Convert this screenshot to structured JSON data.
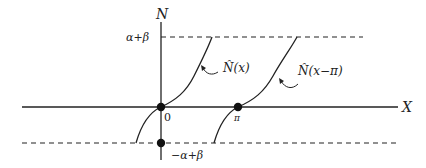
{
  "diagram": {
    "axes": {
      "y_label": "N",
      "x_label": "X"
    },
    "levels": {
      "upper": "α+β",
      "lower": "−α+β"
    },
    "points": {
      "origin": "0",
      "pi": "π"
    },
    "curves": [
      {
        "label_main": "N̂",
        "label_arg": "(x)"
      },
      {
        "label_main": "N̂",
        "label_arg": "(x−π)"
      }
    ],
    "colors": {
      "stroke": "#222222",
      "background": "#ffffff"
    }
  }
}
